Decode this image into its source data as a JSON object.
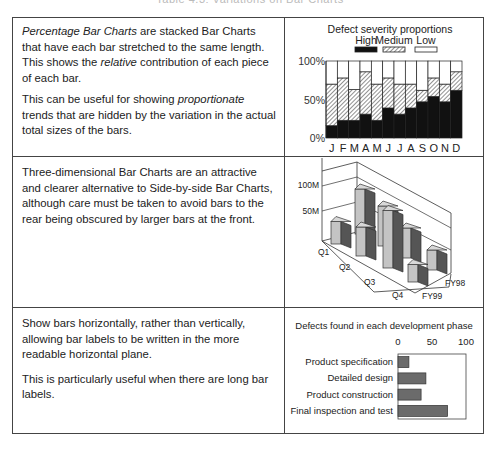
{
  "page": {
    "title_partial": "Table 4.3: Variations on Bar Charts"
  },
  "rows": [
    {
      "text": {
        "p1_italic_lead": "Percentage Bar Charts",
        "p1_rest_a": " are stacked Bar Charts that have each bar stretched to the same length. This shows the ",
        "p1_italic_mid": "relative",
        "p1_rest_b": " contribution of each piece of each bar.",
        "p2_a": "This can be useful for showing ",
        "p2_italic": "proportionate",
        "p2_b": " trends that are hidden by the variation in the actual total sizes of the bars."
      }
    },
    {
      "text": {
        "p1": "Three-dimensional Bar Charts are an attractive and clearer alternative to Side-by-side Bar Charts, although care must be taken to avoid bars to the rear being obscured by larger bars at the front."
      }
    },
    {
      "text": {
        "p1": "Show bars horizontally, rather than vertically, allowing bar labels to be written in the more readable horizontal plane.",
        "p2": "This is particularly useful when there are long bar labels."
      }
    }
  ],
  "chart_data": [
    {
      "type": "bar",
      "subtype": "stacked-percentage",
      "title": "Defect severity proportions",
      "categories": [
        "J",
        "F",
        "M",
        "A",
        "M",
        "J",
        "J",
        "A",
        "S",
        "O",
        "N",
        "D"
      ],
      "series": [
        {
          "name": "High",
          "fill": "solid-black",
          "values": [
            16,
            23,
            23,
            31,
            23,
            39,
            31,
            39,
            47,
            54,
            47,
            62
          ]
        },
        {
          "name": "Medium",
          "fill": "hatched",
          "values": [
            54,
            55,
            40,
            55,
            47,
            39,
            39,
            31,
            15,
            24,
            23,
            24
          ]
        },
        {
          "name": "Low",
          "fill": "white",
          "values": [
            30,
            22,
            37,
            14,
            30,
            22,
            30,
            30,
            38,
            22,
            30,
            14
          ]
        }
      ],
      "yticks": [
        "0%",
        "50%",
        "100%"
      ],
      "ylim": [
        0,
        100
      ],
      "legend_position": "top",
      "grid": false
    },
    {
      "type": "bar",
      "subtype": "3d-grouped",
      "title": "",
      "categories": [
        "Q1",
        "Q2",
        "Q3",
        "Q4"
      ],
      "series": [
        {
          "name": "FY99",
          "values": [
            45,
            58,
            95,
            35
          ]
        },
        {
          "name": "FY98",
          "values": [
            90,
            80,
            60,
            40
          ]
        }
      ],
      "yticks": [
        "50M",
        "100M"
      ],
      "ylim": [
        0,
        100
      ],
      "grid": true
    },
    {
      "type": "bar",
      "subtype": "horizontal",
      "title": "Defects found in each development phase",
      "categories": [
        "Product specification",
        "Detailed design",
        "Product construction",
        "Final inspection and test"
      ],
      "values": [
        16,
        41,
        34,
        73
      ],
      "xticks": [
        "0",
        "50",
        "100"
      ],
      "xlim": [
        0,
        100
      ],
      "grid": false
    }
  ]
}
